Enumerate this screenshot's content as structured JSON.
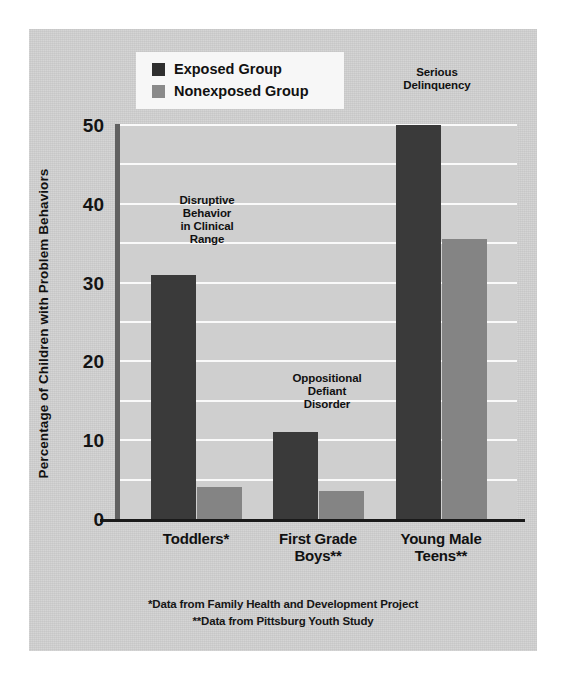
{
  "chart_data": {
    "type": "bar",
    "title": "",
    "xlabel": "",
    "ylabel": "Percentage of Children with Problem Behaviors",
    "ylim": [
      0,
      50
    ],
    "ytick_labels": [
      "50",
      "40",
      "30",
      "20",
      "10",
      "0"
    ],
    "ytick_values": [
      50,
      40,
      30,
      20,
      10,
      0
    ],
    "grid": "horizontal gridlines every 5 units, white, behind bars",
    "legend_position": "top-left inside plot area",
    "categories": [
      "Toddlers*",
      "First Grade\nBoys**",
      "Young Male\nTeens**"
    ],
    "category_lines": [
      [
        "Toddlers*"
      ],
      [
        "First Grade",
        "Boys**"
      ],
      [
        "Young Male",
        "Teens**"
      ]
    ],
    "series": [
      {
        "name": "Exposed Group",
        "color": "#3a3a3a",
        "values": [
          31,
          11,
          50
        ]
      },
      {
        "name": "Nonexposed Group",
        "color": "#848484",
        "values": [
          4,
          3.5,
          35.5
        ]
      }
    ],
    "annotations": [
      {
        "lines": [
          "Disruptive",
          "Behavior",
          "in Clinical",
          "Range"
        ],
        "category": "Toddlers*"
      },
      {
        "lines": [
          "Oppositional",
          "Defiant",
          "Disorder"
        ],
        "category": "First Grade Boys**"
      },
      {
        "lines": [
          "Serious",
          "Delinquency"
        ],
        "category": "Young Male Teens**"
      }
    ],
    "footnotes": [
      "*Data from Family Health and Development Project",
      "**Data from Pittsburg Youth Study"
    ]
  },
  "colors": {
    "exposed": "#3a3a3a",
    "nonexposed": "#848484",
    "plot_background": "#cfcfcf",
    "page_background": "#d2d2d2",
    "gridline": "#fafafa",
    "axis": "#1a1a1a",
    "legend_background": "#f7f7f7"
  }
}
